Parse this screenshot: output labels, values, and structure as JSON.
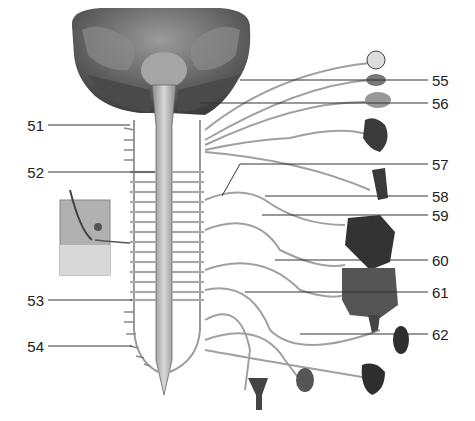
{
  "figure": {
    "left_labels": [
      {
        "num": "51",
        "y": 125,
        "target_x": 130
      },
      {
        "num": "52",
        "y": 172,
        "target_x": 155
      },
      {
        "num": "53",
        "y": 300,
        "target_x": 132
      },
      {
        "num": "54",
        "y": 346,
        "target_x": 132
      }
    ],
    "right_labels": [
      {
        "num": "55",
        "y": 80,
        "target_x": 240
      },
      {
        "num": "56",
        "y": 103,
        "target_x": 200
      },
      {
        "num": "57",
        "y": 164,
        "target_x": 222
      },
      {
        "num": "58",
        "y": 196,
        "target_x": 265
      },
      {
        "num": "59",
        "y": 215,
        "target_x": 262
      },
      {
        "num": "60",
        "y": 260,
        "target_x": 275
      },
      {
        "num": "61",
        "y": 292,
        "target_x": 245
      },
      {
        "num": "62",
        "y": 334,
        "target_x": 300
      }
    ],
    "organs": [
      "eye",
      "lacrimal-gland",
      "salivary-gland",
      "heart",
      "lung",
      "liver-stomach",
      "pancreas",
      "intestines",
      "kidney",
      "bladder",
      "uterus",
      "testis",
      "skin-inset"
    ],
    "colors": {
      "line": "#333333",
      "nerve": "#9a9a9a",
      "cord": "#b8b8b8",
      "brain": "#6d6d6d",
      "organ": "#3a3a3a"
    }
  }
}
